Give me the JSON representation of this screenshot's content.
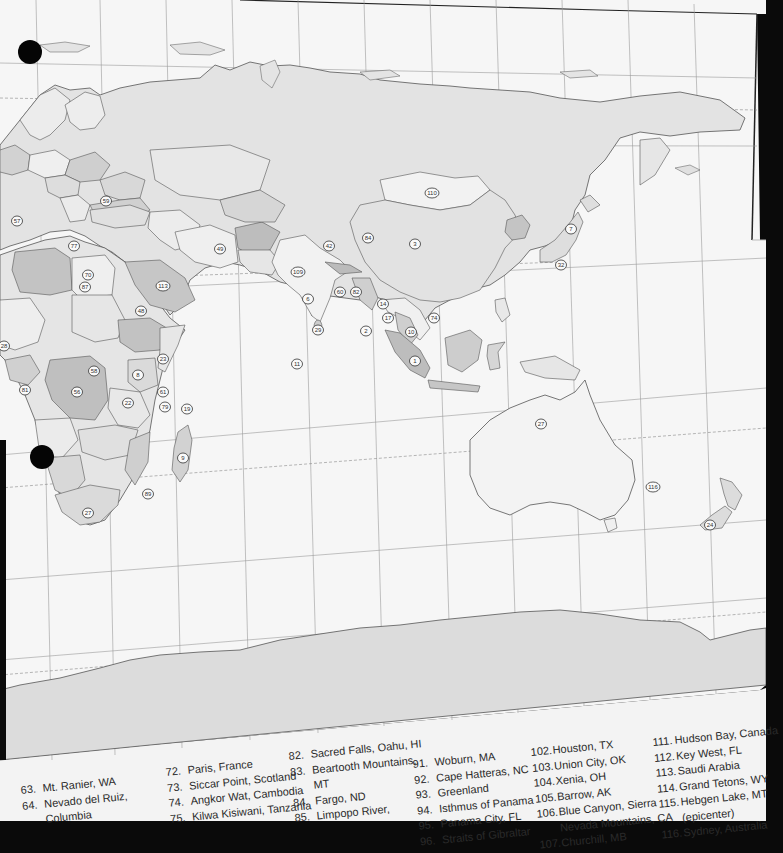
{
  "map": {
    "colors": {
      "paper": "#f4f4f4",
      "ocean": "#f7f7f7",
      "land_light": "#e9e9e9",
      "land_mid": "#d6d6d6",
      "land_dark": "#bdbdbd",
      "antarctica": "#dcdcdc",
      "border": "#555555",
      "grid": "#9a9a9a",
      "background": "#0a0a0a"
    },
    "markers": [
      {
        "label": "57",
        "x": 17,
        "y": 221
      },
      {
        "label": "59",
        "x": 106,
        "y": 201
      },
      {
        "label": "77",
        "x": 74,
        "y": 246
      },
      {
        "label": "70",
        "x": 88,
        "y": 275
      },
      {
        "label": "87",
        "x": 85,
        "y": 287
      },
      {
        "label": "113",
        "x": 163,
        "y": 286
      },
      {
        "label": "48",
        "x": 141,
        "y": 311
      },
      {
        "label": "28",
        "x": 4,
        "y": 346
      },
      {
        "label": "58",
        "x": 94,
        "y": 371
      },
      {
        "label": "56",
        "x": 77,
        "y": 392
      },
      {
        "label": "8",
        "x": 138,
        "y": 375
      },
      {
        "label": "81",
        "x": 25,
        "y": 390
      },
      {
        "label": "23",
        "x": 163,
        "y": 359
      },
      {
        "label": "61",
        "x": 163,
        "y": 392
      },
      {
        "label": "22",
        "x": 128,
        "y": 403
      },
      {
        "label": "79",
        "x": 165,
        "y": 407
      },
      {
        "label": "19",
        "x": 187,
        "y": 409
      },
      {
        "label": "9",
        "x": 183,
        "y": 458
      },
      {
        "label": "89",
        "x": 148,
        "y": 494
      },
      {
        "label": "27",
        "x": 88,
        "y": 513
      },
      {
        "label": "49",
        "x": 220,
        "y": 249
      },
      {
        "label": "109",
        "x": 298,
        "y": 272
      },
      {
        "label": "42",
        "x": 329,
        "y": 246
      },
      {
        "label": "84",
        "x": 368,
        "y": 238
      },
      {
        "label": "3",
        "x": 415,
        "y": 244
      },
      {
        "label": "110",
        "x": 432,
        "y": 193
      },
      {
        "label": "7",
        "x": 571,
        "y": 229
      },
      {
        "label": "32",
        "x": 561,
        "y": 265
      },
      {
        "label": "6",
        "x": 308,
        "y": 299
      },
      {
        "label": "60",
        "x": 340,
        "y": 292
      },
      {
        "label": "82",
        "x": 356,
        "y": 292
      },
      {
        "label": "14",
        "x": 383,
        "y": 304
      },
      {
        "label": "17",
        "x": 388,
        "y": 318
      },
      {
        "label": "10",
        "x": 411,
        "y": 332
      },
      {
        "label": "2",
        "x": 366,
        "y": 331
      },
      {
        "label": "74",
        "x": 434,
        "y": 318
      },
      {
        "label": "1",
        "x": 415,
        "y": 361
      },
      {
        "label": "29",
        "x": 318,
        "y": 330
      },
      {
        "label": "11",
        "x": 297,
        "y": 364
      },
      {
        "label": "27",
        "x": 541,
        "y": 424
      },
      {
        "label": "116",
        "x": 653,
        "y": 487
      },
      {
        "label": "24",
        "x": 710,
        "y": 525
      }
    ]
  },
  "legend": {
    "columns": [
      {
        "items": [
          {
            "num": "63.",
            "text": "Mt. Ranier, WA"
          },
          {
            "num": "64.",
            "text": "Nevado del Ruiz,",
            "cont": "Columbia"
          }
        ]
      },
      {
        "items": [
          {
            "num": "72.",
            "text": "Paris, France"
          },
          {
            "num": "73.",
            "text": "Siccar Point, Scotland"
          },
          {
            "num": "74.",
            "text": "Angkor Wat, Cambodia"
          },
          {
            "num": "75.",
            "text": "Kilwa Kisiwani, Tanzania"
          }
        ]
      },
      {
        "items": [
          {
            "num": "82.",
            "text": "Sacred Falls, Oahu, HI"
          },
          {
            "num": "83.",
            "text": "Beartooth Mountains,",
            "cont": "MT"
          },
          {
            "num": "84.",
            "text": "Fargo, ND"
          },
          {
            "num": "85.",
            "text": "Limpopo River,"
          }
        ]
      },
      {
        "items": [
          {
            "num": "91.",
            "text": "Woburn, MA"
          },
          {
            "num": "92.",
            "text": "Cape Hatteras, NC"
          },
          {
            "num": "93.",
            "text": "Greenland"
          },
          {
            "num": "94.",
            "text": "Isthmus of Panama"
          },
          {
            "num": "95.",
            "text": "Panama City, FL"
          },
          {
            "num": "96.",
            "text": "Straits of Gibraltar"
          }
        ]
      },
      {
        "items": [
          {
            "num": "102.",
            "text": "Houston, TX"
          },
          {
            "num": "103.",
            "text": "Union City, OK"
          },
          {
            "num": "104.",
            "text": "Xenia, OH"
          },
          {
            "num": "105.",
            "text": "Barrow, AK"
          },
          {
            "num": "106.",
            "text": "Blue Canyon, Sierra",
            "cont": "Nevada Mountains, CA"
          },
          {
            "num": "107.",
            "text": "Churchill, MB"
          }
        ]
      },
      {
        "items": [
          {
            "num": "111.",
            "text": "Hudson Bay, Canada"
          },
          {
            "num": "112.",
            "text": "Key West, FL"
          },
          {
            "num": "113.",
            "text": "Saudi Arabia"
          },
          {
            "num": "114.",
            "text": "Grand Tetons, WY"
          },
          {
            "num": "115.",
            "text": "Hebgen Lake, MT",
            "cont": "(epicenter)"
          },
          {
            "num": "116.",
            "text": "Sydney, Australia"
          }
        ]
      }
    ]
  }
}
